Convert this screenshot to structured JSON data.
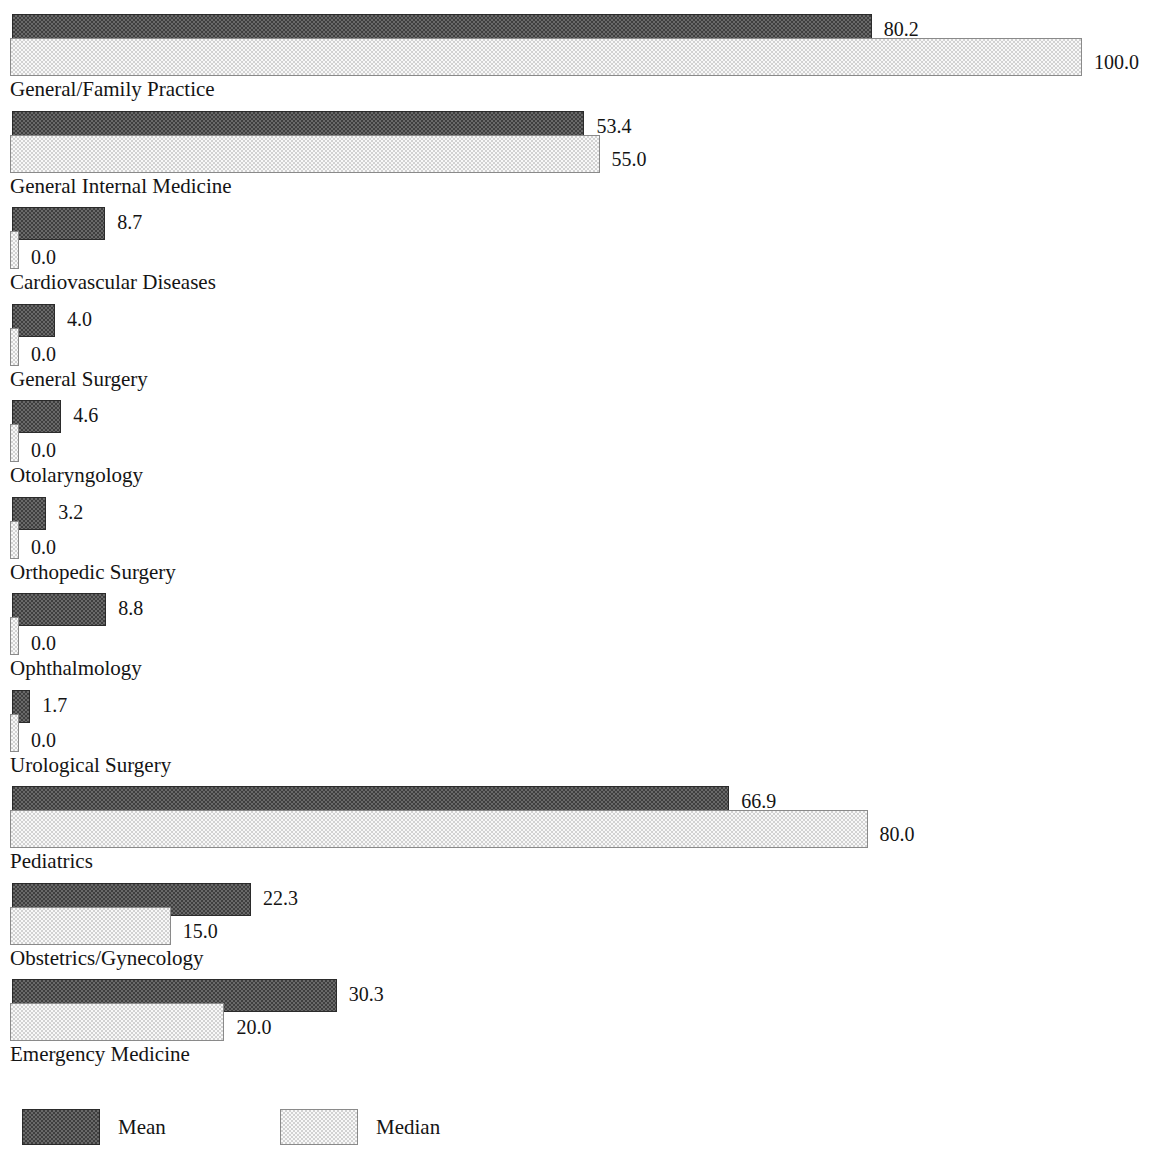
{
  "chart_data": {
    "type": "bar",
    "orientation": "horizontal",
    "title": "",
    "xlabel": "",
    "ylabel": "",
    "xlim": [
      0,
      100
    ],
    "grid": false,
    "legend_position": "bottom-left",
    "categories": [
      "General/Family Practice",
      "General Internal Medicine",
      "Cardiovascular Diseases",
      "General Surgery",
      "Otolaryngology",
      "Orthopedic Surgery",
      "Ophthalmology",
      "Urological Surgery",
      "Pediatrics",
      "Obstetrics/Gynecology",
      "Emergency Medicine"
    ],
    "series": [
      {
        "name": "Mean",
        "color": "#3f3f3f",
        "values": [
          80.2,
          53.4,
          8.7,
          4.0,
          4.6,
          3.2,
          8.8,
          1.7,
          66.9,
          22.3,
          30.3
        ],
        "labels": [
          "80.2",
          "53.4",
          "8.7",
          "4.0",
          "4.6",
          "3.2",
          "8.8",
          "1.7",
          "66.9",
          "22.3",
          "30.3"
        ]
      },
      {
        "name": "Median",
        "color": "#d2d2d2",
        "values": [
          100.0,
          55.0,
          0.0,
          0.0,
          0.0,
          0.0,
          0.0,
          0.0,
          80.0,
          15.0,
          20.0
        ],
        "labels": [
          "100.0",
          "55.0",
          "0.0",
          "0.0",
          "0.0",
          "0.0",
          "0.0",
          "0.0",
          "80.0",
          "15.0",
          "20.0"
        ]
      }
    ]
  },
  "legend": {
    "entries": [
      {
        "label": "Mean",
        "swatch": "mean"
      },
      {
        "label": "Median",
        "swatch": "median"
      }
    ]
  }
}
